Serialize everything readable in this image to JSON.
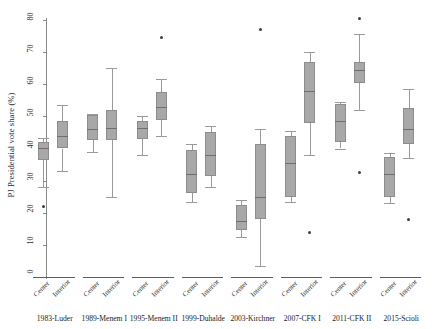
{
  "chart_data": {
    "type": "box",
    "title": "",
    "xlabel": "",
    "ylabel": "PJ Presidential vote share (%)",
    "ylim": [
      0,
      80
    ],
    "yticks": [
      0,
      10,
      20,
      30,
      40,
      50,
      60,
      70,
      80
    ],
    "ytick_labels": [
      "0",
      "10",
      "20",
      "30",
      "40",
      "50",
      "60",
      "70",
      "80"
    ],
    "grid": false,
    "legend": "none",
    "subgroup_labels": [
      "Center",
      "Interior"
    ],
    "categories": [
      "1983-Luder",
      "1989-Menem I",
      "1995-Menem II",
      "1999-Duhalde",
      "2003-Kirchner",
      "2007-CFK I",
      "2011-CFK II",
      "2015-Scioli"
    ],
    "series": [
      {
        "name": "Center",
        "boxes": [
          {
            "group": "1983-Luder",
            "whisker_low": 28.0,
            "q1": 36.5,
            "median": 40.2,
            "q3": 42.0,
            "whisker_high": 43.2,
            "outliers": [
              22.0
            ]
          },
          {
            "group": "1989-Menem I",
            "whisker_low": 38.8,
            "q1": 42.5,
            "median": 46.0,
            "q3": 50.5,
            "whisker_high": 50.8,
            "outliers": []
          },
          {
            "group": "1995-Menem II",
            "whisker_low": 38.0,
            "q1": 43.0,
            "median": 46.5,
            "q3": 48.5,
            "whisker_high": 50.0,
            "outliers": []
          },
          {
            "group": "1999-Duhalde",
            "whisker_low": 23.5,
            "q1": 26.0,
            "median": 32.0,
            "q3": 39.5,
            "whisker_high": 41.5,
            "outliers": []
          },
          {
            "group": "2003-Kirchner",
            "whisker_low": 12.5,
            "q1": 14.5,
            "median": 17.5,
            "q3": 22.5,
            "whisker_high": 24.0,
            "outliers": []
          },
          {
            "group": "2007-CFK I",
            "whisker_low": 23.5,
            "q1": 25.0,
            "median": 35.5,
            "q3": 44.0,
            "whisker_high": 45.5,
            "outliers": []
          },
          {
            "group": "2011-CFK II",
            "whisker_low": 40.0,
            "q1": 42.0,
            "median": 48.5,
            "q3": 54.0,
            "whisker_high": 54.5,
            "outliers": []
          },
          {
            "group": "2015-Scioli",
            "whisker_low": 23.0,
            "q1": 25.0,
            "median": 32.0,
            "q3": 37.5,
            "whisker_high": 38.5,
            "outliers": []
          }
        ]
      },
      {
        "name": "Interior",
        "boxes": [
          {
            "group": "1983-Luder",
            "whisker_low": 33.0,
            "q1": 40.0,
            "median": 43.8,
            "q3": 48.5,
            "whisker_high": 53.5,
            "outliers": []
          },
          {
            "group": "1989-Menem I",
            "whisker_low": 25.0,
            "q1": 42.5,
            "median": 46.5,
            "q3": 52.0,
            "whisker_high": 65.0,
            "outliers": []
          },
          {
            "group": "1995-Menem II",
            "whisker_low": 44.0,
            "q1": 49.0,
            "median": 53.0,
            "q3": 57.5,
            "whisker_high": 61.5,
            "outliers": [
              74.5
            ]
          },
          {
            "group": "1999-Duhalde",
            "whisker_low": 28.0,
            "q1": 31.5,
            "median": 38.0,
            "q3": 45.0,
            "whisker_high": 47.0,
            "outliers": []
          },
          {
            "group": "2003-Kirchner",
            "whisker_low": 3.5,
            "q1": 18.0,
            "median": 25.0,
            "q3": 41.5,
            "whisker_high": 46.0,
            "outliers": [
              77.0
            ]
          },
          {
            "group": "2007-CFK I",
            "whisker_low": 38.0,
            "q1": 48.0,
            "median": 58.0,
            "q3": 67.0,
            "whisker_high": 70.0,
            "outliers": [
              14.0
            ]
          },
          {
            "group": "2011-CFK II",
            "whisker_low": 52.0,
            "q1": 60.5,
            "median": 64.5,
            "q3": 67.0,
            "whisker_high": 75.5,
            "outliers": [
              80.5,
              32.5
            ]
          },
          {
            "group": "2015-Scioli",
            "whisker_low": 37.0,
            "q1": 41.5,
            "median": 46.0,
            "q3": 52.5,
            "whisker_high": 58.5,
            "outliers": [
              18.0
            ]
          }
        ]
      }
    ]
  }
}
